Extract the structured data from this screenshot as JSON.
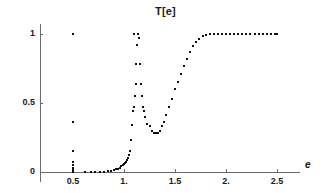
{
  "chart_data": {
    "type": "scatter",
    "title": "T[e]",
    "xlabel": "e",
    "ylabel": "",
    "xlim": [
      0.05,
      2.78
    ],
    "ylim": [
      -0.04,
      1.08
    ],
    "grid": false,
    "legend": null,
    "xticks": [
      0.5,
      1.0,
      1.5,
      2.0,
      2.5
    ],
    "xticklabels": [
      "0.5",
      "1.",
      "1.5",
      "2.",
      "2.5"
    ],
    "yticks": [
      0,
      0.5,
      1
    ],
    "yticklabels": [
      "0",
      "0.5",
      "1"
    ],
    "marker": "square-dot",
    "marker_color": "#101010",
    "axis_color": "#6b6b6b",
    "series": [
      {
        "name": "T[e]",
        "x": [
          0.5,
          0.5,
          0.5,
          0.5,
          0.5,
          0.5,
          0.5,
          0.5,
          0.62,
          0.68,
          0.72,
          0.76,
          0.8,
          0.84,
          0.87,
          0.9,
          0.92,
          0.94,
          0.96,
          0.975,
          0.99,
          1.0,
          1.01,
          1.02,
          1.03,
          1.04,
          1.05,
          1.06,
          1.07,
          1.08,
          1.09,
          1.1,
          1.11,
          1.115,
          1.12,
          1.13,
          1.14,
          1.15,
          1.16,
          1.17,
          1.18,
          1.19,
          1.2,
          1.21,
          1.23,
          1.25,
          1.27,
          1.29,
          1.31,
          1.33,
          1.35,
          1.37,
          1.39,
          1.41,
          1.44,
          1.47,
          1.5,
          1.53,
          1.56,
          1.59,
          1.62,
          1.65,
          1.68,
          1.71,
          1.74,
          1.77,
          1.8,
          1.84,
          1.88,
          1.92,
          1.96,
          2.0,
          2.04,
          2.08,
          2.12,
          2.16,
          2.2,
          2.24,
          2.28,
          2.32,
          2.36,
          2.4,
          2.44,
          2.48,
          2.5
        ],
        "y": [
          0.0,
          0.01,
          0.02,
          0.03,
          0.05,
          0.075,
          0.155,
          0.36,
          0.0,
          0.0,
          0.0,
          0.0,
          0.0,
          0.005,
          0.01,
          0.015,
          0.02,
          0.025,
          0.03,
          0.04,
          0.05,
          0.055,
          0.065,
          0.075,
          0.09,
          0.1,
          0.125,
          0.155,
          0.235,
          0.34,
          0.44,
          0.47,
          0.55,
          0.64,
          0.78,
          0.92,
          1.0,
          0.97,
          0.78,
          0.64,
          0.55,
          0.47,
          0.44,
          0.4,
          0.35,
          0.33,
          0.3,
          0.285,
          0.28,
          0.285,
          0.3,
          0.33,
          0.365,
          0.41,
          0.47,
          0.53,
          0.6,
          0.655,
          0.71,
          0.765,
          0.82,
          0.87,
          0.91,
          0.94,
          0.965,
          0.985,
          0.995,
          1.0,
          1.0,
          1.0,
          1.0,
          1.0,
          1.0,
          1.0,
          1.0,
          1.0,
          1.0,
          1.0,
          1.0,
          1.0,
          1.0,
          1.0,
          1.0,
          1.0,
          1.0
        ],
        "note_branches": [
          {
            "name": "vertical-cluster-at-0.5",
            "description": "Column of points at e=0.5 spanning T=0 to 0.155, plus isolated points at 0.36 and 1.0"
          },
          {
            "name": "rising-branch",
            "description": "Exponential rise from T~0 near e=0.9 to T=1 at e~1.14"
          },
          {
            "name": "dip-branch",
            "description": "Descent from T=1 at e~1.15 to minimum T~0.28 near e=1.31"
          },
          {
            "name": "second-rise",
            "description": "Rise from T~0.28 at e=1.31 to T=1 at e~1.84"
          },
          {
            "name": "plateau",
            "description": "Flat T=1 from e~1.72 to e=2.5"
          }
        ],
        "extra_points": [
          {
            "x": 0.5,
            "y": 1.0
          },
          {
            "x": 1.1,
            "y": 1.0
          }
        ]
      }
    ]
  },
  "axis": {
    "x_label": "e",
    "tick_labels_x": [
      "0.5",
      "1.",
      "1.5",
      "2.",
      "2.5"
    ],
    "tick_labels_y": [
      "0",
      "0.5",
      "1"
    ]
  }
}
